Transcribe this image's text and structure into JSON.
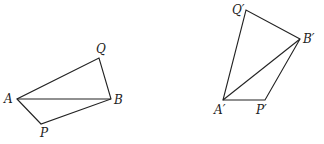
{
  "figure": {
    "left": {
      "labels": {
        "A": "A",
        "B": "B",
        "P": "P",
        "Q": "Q"
      },
      "points": {
        "A": [
          17,
          99
        ],
        "B": [
          111,
          99
        ],
        "P": [
          41,
          124
        ],
        "Q": [
          99,
          58
        ]
      }
    },
    "right": {
      "labels": {
        "A": "A′",
        "B": "B′",
        "P": "P′",
        "Q": "Q′"
      },
      "points": {
        "A": [
          223,
          100
        ],
        "B": [
          300,
          39
        ],
        "P": [
          265,
          100
        ],
        "Q": [
          246,
          10
        ]
      }
    },
    "line_color": "#222222"
  }
}
